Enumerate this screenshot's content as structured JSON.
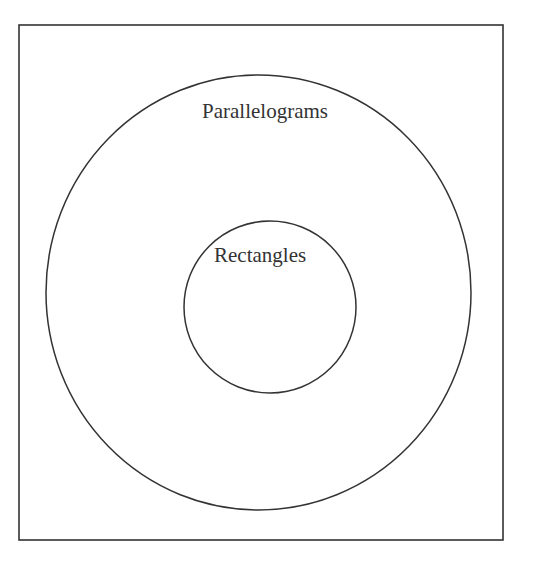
{
  "diagram": {
    "type": "venn-nested",
    "outer_set": {
      "label": "Parallelograms"
    },
    "inner_set": {
      "label": "Rectangles"
    },
    "colors": {
      "stroke": "#333333",
      "background": "#ffffff"
    }
  }
}
